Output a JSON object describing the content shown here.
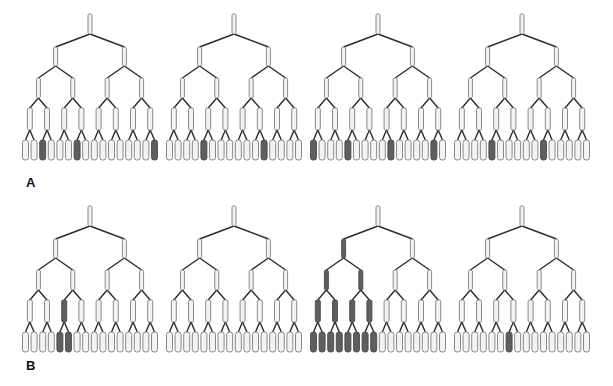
{
  "figure": {
    "panels": [
      {
        "label": "A",
        "label_pos": [
          26,
          175
        ],
        "row_top": 14,
        "trees": [
          {
            "root_x": 90,
            "shaded": {
              "level1": [],
              "level2": [],
              "level3": [],
              "level4": [],
              "leaves": [
                3,
                7,
                16
              ]
            }
          },
          {
            "root_x": 234,
            "shaded": {
              "level1": [],
              "level2": [],
              "level3": [],
              "level4": [],
              "leaves": [
                5,
                12
              ]
            }
          },
          {
            "root_x": 378,
            "shaded": {
              "level1": [],
              "level2": [],
              "level3": [],
              "level4": [],
              "leaves": [
                1,
                5,
                10,
                15
              ]
            }
          },
          {
            "root_x": 522,
            "shaded": {
              "level1": [],
              "level2": [],
              "level3": [],
              "level4": [],
              "leaves": [
                5,
                11
              ]
            }
          }
        ]
      },
      {
        "label": "B",
        "label_pos": [
          26,
          358
        ],
        "row_top": 206,
        "trees": [
          {
            "root_x": 90,
            "shaded": {
              "level1": [],
              "level2": [],
              "level3": [],
              "level4": [
                3
              ],
              "leaves": [
                5,
                6
              ]
            }
          },
          {
            "root_x": 234,
            "shaded": {
              "level1": [],
              "level2": [],
              "level3": [],
              "level4": [],
              "leaves": []
            }
          },
          {
            "root_x": 378,
            "shaded": {
              "level1": [],
              "level2": [
                1
              ],
              "level3": [
                1,
                2
              ],
              "level4": [
                1,
                2,
                3,
                4
              ],
              "leaves": [
                1,
                2,
                3,
                4,
                5,
                6,
                7,
                8
              ]
            }
          },
          {
            "root_x": 522,
            "shaded": {
              "level1": [],
              "level2": [],
              "level3": [],
              "level4": [],
              "leaves": [
                7
              ]
            }
          }
        ]
      }
    ],
    "tree_structure": {
      "levels": 5,
      "nodes_per_level": [
        1,
        2,
        4,
        8,
        16
      ],
      "branching": 2
    },
    "colors": {
      "unshaded_fill": "#f3f3f3",
      "shaded_fill": "#5e5e5e",
      "edge": "#2a2a2a",
      "node_border": "#7a7a7a"
    }
  }
}
